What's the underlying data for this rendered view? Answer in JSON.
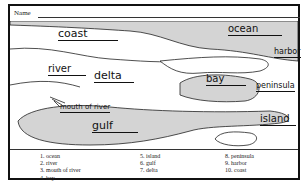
{
  "worksheet": {
    "name_label": "Name",
    "map_labels": {
      "coast": "coast",
      "ocean": "ocean",
      "harbor": "harbor",
      "river": "river",
      "delta": "delta",
      "bay": "bay",
      "peninsula": "peninsula",
      "mouth_of_river": "mouth of river",
      "island": "island",
      "gulf": "gulf"
    },
    "key": {
      "col1": [
        "1. ocean",
        "2. river",
        "3. mouth of river",
        "4. bay"
      ],
      "col2": [
        "5. island",
        "6. gulf",
        "7. delta"
      ],
      "col3": [
        "8. peninsula",
        "9. harbor",
        "10. coast"
      ]
    },
    "colors": {
      "water": "#d4d4d4",
      "land": "#ffffff",
      "ink": "#111111"
    }
  }
}
